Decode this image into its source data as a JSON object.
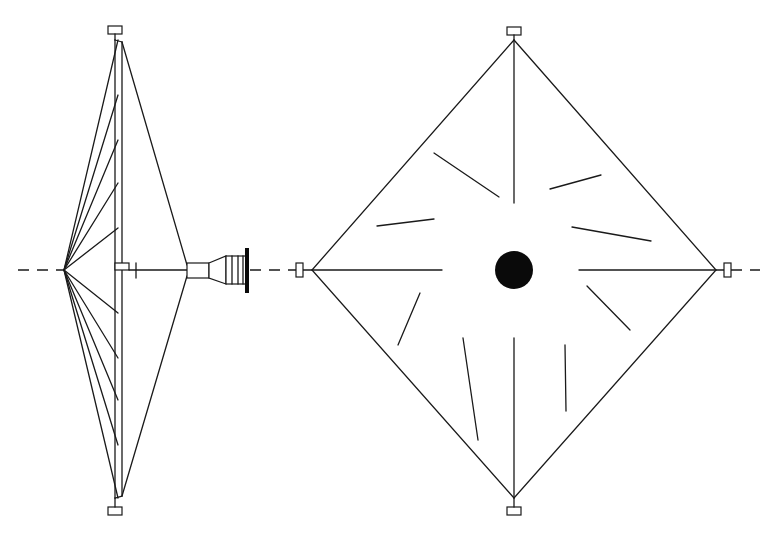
{
  "diagram": {
    "colors": {
      "line": "#1a1a1a",
      "fill": "#0a0a0a",
      "background": "#ffffff"
    },
    "axis": {
      "y": 270,
      "style": "dashed"
    },
    "side_view": {
      "mast": {
        "x": 118,
        "top": 40,
        "bottom": 498,
        "width": 6
      },
      "apex": {
        "x": 64,
        "y": 270
      },
      "rib_attach_y": [
        40,
        95,
        140,
        183,
        228,
        313,
        358,
        400,
        445,
        498
      ],
      "rear_stay_vertex": {
        "x": 187,
        "y": 270
      },
      "tip_boxes": [
        {
          "x": 108,
          "y": 26,
          "w": 14,
          "h": 8
        },
        {
          "x": 108,
          "y": 507,
          "w": 14,
          "h": 8
        }
      ],
      "engine": {
        "collar": {
          "x": 187,
          "y": 263,
          "w": 22,
          "h": 15
        },
        "cone_start_x": 209,
        "cone_end_x": 226,
        "barrel": {
          "x": 226,
          "y": 256,
          "w": 20,
          "h": 28,
          "rings": 3
        },
        "end_plate": {
          "x": 245,
          "y": 248,
          "w": 4,
          "h": 45
        }
      }
    },
    "front_view": {
      "top": {
        "x": 514,
        "y": 40
      },
      "bottom": {
        "x": 514,
        "y": 498
      },
      "left": {
        "x": 312,
        "y": 270
      },
      "right": {
        "x": 716,
        "y": 270
      },
      "hub": {
        "cx": 514,
        "cy": 270,
        "r": 19
      },
      "spokes": [
        {
          "x1": 514,
          "y1": 40,
          "x2": 514,
          "y2": 203
        },
        {
          "x1": 514,
          "y1": 338,
          "x2": 514,
          "y2": 498
        },
        {
          "x1": 312,
          "y1": 270,
          "x2": 442,
          "y2": 270
        },
        {
          "x1": 579,
          "y1": 270,
          "x2": 716,
          "y2": 270
        }
      ],
      "vanes": [
        {
          "x1": 434,
          "y1": 153,
          "x2": 499,
          "y2": 197
        },
        {
          "x1": 377,
          "y1": 226,
          "x2": 434,
          "y2": 219
        },
        {
          "x1": 550,
          "y1": 189,
          "x2": 601,
          "y2": 175
        },
        {
          "x1": 572,
          "y1": 227,
          "x2": 651,
          "y2": 241
        },
        {
          "x1": 420,
          "y1": 293,
          "x2": 398,
          "y2": 345
        },
        {
          "x1": 463,
          "y1": 338,
          "x2": 478,
          "y2": 440
        },
        {
          "x1": 587,
          "y1": 286,
          "x2": 630,
          "y2": 330
        },
        {
          "x1": 565,
          "y1": 345,
          "x2": 566,
          "y2": 411
        }
      ],
      "tip_boxes": [
        {
          "x": 507,
          "y": 27,
          "w": 14,
          "h": 8
        },
        {
          "x": 507,
          "y": 507,
          "w": 14,
          "h": 8
        },
        {
          "x": 296,
          "y": 263,
          "w": 7,
          "h": 14
        },
        {
          "x": 724,
          "y": 263,
          "w": 7,
          "h": 14
        }
      ]
    }
  }
}
